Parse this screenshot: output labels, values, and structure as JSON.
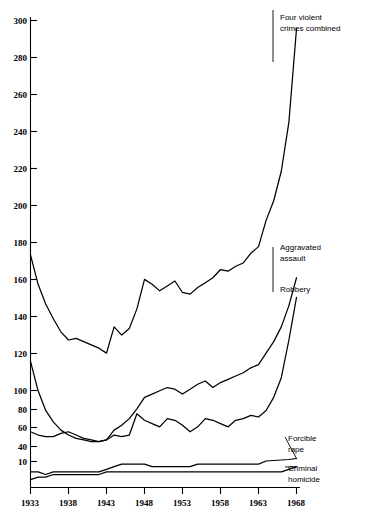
{
  "chart_data": {
    "type": "line",
    "title": "",
    "xlabel": "",
    "ylabel": "",
    "grid": false,
    "legend_position": "right-inline-annotations",
    "x": [
      1933,
      1934,
      1935,
      1936,
      1937,
      1938,
      1939,
      1940,
      1941,
      1942,
      1943,
      1944,
      1945,
      1946,
      1947,
      1948,
      1949,
      1950,
      1951,
      1952,
      1953,
      1954,
      1955,
      1956,
      1957,
      1958,
      1959,
      1960,
      1961,
      1962,
      1963,
      1964,
      1965,
      1966,
      1967,
      1968
    ],
    "xlim": [
      1933,
      1968
    ],
    "xticks": [
      1933,
      1938,
      1943,
      1948,
      1953,
      1958,
      1963,
      1968
    ],
    "xticklabels": [
      "1933",
      "1938",
      "1943",
      "1948",
      "1953",
      "1958",
      "1963",
      "1968"
    ],
    "yticks": [
      10,
      40,
      60,
      80,
      100,
      120,
      140,
      160,
      180,
      200,
      220,
      240,
      260,
      280,
      300
    ],
    "yticklabels": [
      "10",
      "40",
      "60",
      "80",
      "100",
      "120",
      "140",
      "160",
      "180",
      "200",
      "220",
      "240",
      "260",
      "280",
      "300"
    ],
    "y_axis_break": "between 10 and 40",
    "ylim": [
      0,
      300
    ],
    "series": [
      {
        "name": "Four violent crimes combined",
        "label_line1": "Four violent",
        "label_line2": "crimes combined",
        "values": [
          157,
          139,
          127,
          118,
          110,
          105,
          106,
          104,
          102,
          100,
          97,
          113,
          108,
          112,
          124,
          142,
          139,
          135,
          138,
          141,
          134,
          133,
          137,
          140,
          143,
          148,
          147,
          150,
          152,
          158,
          162,
          178,
          190,
          208,
          238,
          295
        ]
      },
      {
        "name": "Aggravated assault",
        "label_line1": "Aggravated",
        "label_line2": "assault",
        "values": [
          92,
          74,
          62,
          55,
          50,
          47,
          45,
          44,
          43,
          43,
          44,
          50,
          53,
          57,
          63,
          70,
          72,
          74,
          76,
          75,
          72,
          75,
          78,
          80,
          76,
          79,
          81,
          83,
          85,
          88,
          90,
          97,
          104,
          113,
          126,
          143
        ]
      },
      {
        "name": "Robbery",
        "label_line1": "Robbery",
        "label_line2": "",
        "values": [
          49,
          47,
          46,
          46,
          48,
          49,
          47,
          45,
          44,
          43,
          44,
          47,
          46,
          47,
          60,
          56,
          54,
          52,
          57,
          56,
          53,
          49,
          52,
          57,
          56,
          54,
          52,
          56,
          57,
          59,
          58,
          62,
          70,
          82,
          105,
          131
        ]
      },
      {
        "name": "Forcible rape",
        "label_line1": "Forcible",
        "label_line2": "rape",
        "values": [
          6,
          6,
          5,
          6,
          6,
          6,
          6,
          6,
          6,
          6,
          7,
          8,
          9,
          9,
          9,
          9,
          8,
          8,
          8,
          8,
          8,
          8,
          9,
          9,
          9,
          9,
          9,
          9,
          9,
          9,
          9,
          11,
          12,
          13,
          14,
          16
        ]
      },
      {
        "name": "Criminal homicide",
        "label_line1": "Criminal",
        "label_line2": "homicide",
        "values": [
          3,
          4,
          4,
          5,
          5,
          5,
          5,
          5,
          5,
          5,
          6,
          6,
          6,
          6,
          6,
          6,
          6,
          6,
          6,
          6,
          6,
          6,
          6,
          6,
          6,
          6,
          6,
          6,
          6,
          6,
          6,
          6,
          6,
          6,
          7,
          8
        ]
      }
    ],
    "annotations": [
      {
        "text": "Four violent crimes combined",
        "series": "Four violent crimes combined"
      },
      {
        "text": "Aggravated assault",
        "series": "Aggravated assault"
      },
      {
        "text": "Robbery",
        "series": "Robbery"
      },
      {
        "text": "Forcible rape",
        "series": "Forcible rape"
      },
      {
        "text": "Criminal homicide",
        "series": "Criminal homicide"
      }
    ],
    "colors": {
      "line": "#000000",
      "background": "#ffffff",
      "axis": "#000000"
    }
  },
  "axis": {
    "y_ticks": [
      {
        "label": "300"
      },
      {
        "label": "280"
      },
      {
        "label": "260"
      },
      {
        "label": "240"
      },
      {
        "label": "220"
      },
      {
        "label": "200"
      },
      {
        "label": "180"
      },
      {
        "label": "160"
      },
      {
        "label": "140"
      },
      {
        "label": "120"
      },
      {
        "label": "100"
      },
      {
        "label": "80"
      },
      {
        "label": "60"
      },
      {
        "label": "40"
      },
      {
        "label": "10"
      }
    ],
    "x_ticks": [
      {
        "label": "1933"
      },
      {
        "label": "1938"
      },
      {
        "label": "1943"
      },
      {
        "label": "1948"
      },
      {
        "label": "1953"
      },
      {
        "label": "1958"
      },
      {
        "label": "1963"
      },
      {
        "label": "1968"
      }
    ]
  },
  "labels": {
    "combined_1": "Four violent",
    "combined_2": "crimes combined",
    "assault_1": "Aggravated",
    "assault_2": "assault",
    "robbery": "Robbery",
    "rape_1": "Forcible",
    "rape_2": "rape",
    "homicide_1": "Criminal",
    "homicide_2": "homicide"
  }
}
